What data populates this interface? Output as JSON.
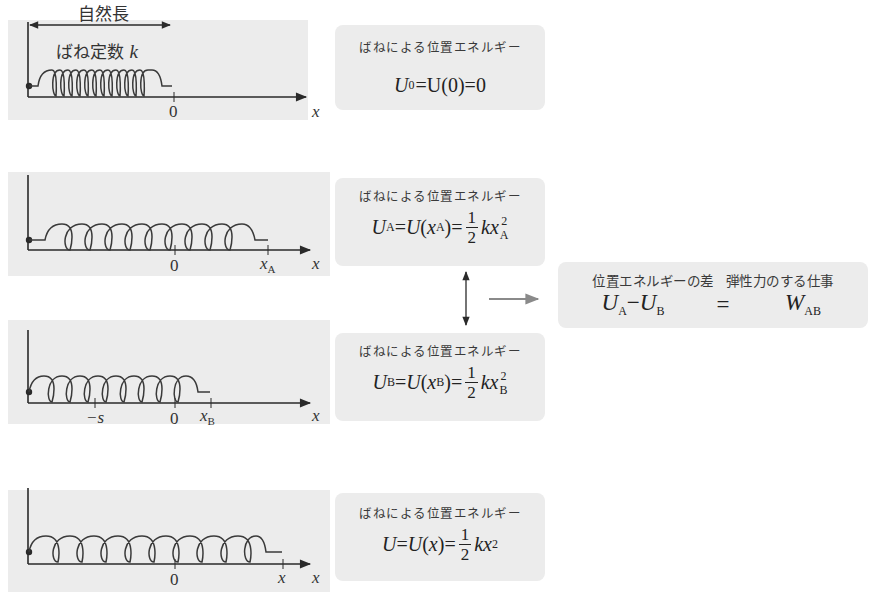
{
  "diagram": {
    "header": {
      "natural_length_label": "自然長",
      "spring_constant_label": "ばね定数",
      "spring_constant_symbol": "k"
    },
    "panels": [
      {
        "id": "natural",
        "axis_label": "x",
        "ticks": [
          {
            "label": "0",
            "var": ""
          }
        ],
        "box": {
          "caption": "ばねによる位置エネルギー",
          "equation": "U₀=U(0)=0",
          "lhs": "U",
          "lhs_sub": "0",
          "mid": "=U(0)=0"
        }
      },
      {
        "id": "stretched-A",
        "axis_label": "x",
        "ticks": [
          {
            "label": "0"
          },
          {
            "label": "x",
            "sub": "A"
          }
        ],
        "box": {
          "caption": "ばねによる位置エネルギー",
          "equation": "U_A=U(x_A)=1/2 kx_A^2",
          "lhs": "U",
          "lhs_sub": "A",
          "arg": "x",
          "arg_sub": "A",
          "frac_num": "1",
          "frac_den": "2",
          "k": "k",
          "var": "x",
          "var_sub": "A",
          "power": "2"
        }
      },
      {
        "id": "compressed-B",
        "axis_label": "x",
        "ticks": [
          {
            "label": "−s"
          },
          {
            "label": "0"
          },
          {
            "label": "x",
            "sub": "B"
          }
        ],
        "box": {
          "caption": "ばねによる位置エネルギー",
          "equation": "U_B=U(x_B)=1/2 kx_B^2",
          "lhs": "U",
          "lhs_sub": "B",
          "arg": "x",
          "arg_sub": "B",
          "frac_num": "1",
          "frac_den": "2",
          "k": "k",
          "var": "x",
          "var_sub": "B",
          "power": "2"
        }
      },
      {
        "id": "general-x",
        "axis_label": "x",
        "ticks": [
          {
            "label": "0"
          },
          {
            "label": "x"
          }
        ],
        "box": {
          "caption": "ばねによる位置エネルギー",
          "equation": "U=U(x)=1/2 kx^2",
          "lhs": "U",
          "arg": "x",
          "frac_num": "1",
          "frac_den": "2",
          "k": "k",
          "var": "x",
          "power": "2"
        }
      }
    ],
    "summary": {
      "left_caption": "位置エネルギーの差",
      "right_caption": "弾性力のする仕事",
      "lhs_a": "U",
      "lhs_a_sub": "A",
      "minus": "−",
      "lhs_b": "U",
      "lhs_b_sub": "B",
      "equals": "=",
      "rhs": "W",
      "rhs_sub": "AB"
    },
    "colors": {
      "panel_bg": "#ececec",
      "line": "#2a2a2a",
      "arrow_gray": "#8a8a8a",
      "text": "#333333"
    }
  }
}
